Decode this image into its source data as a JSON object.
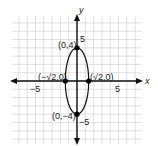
{
  "chart_data": {
    "type": "scatter",
    "title": "",
    "xlabel": "x",
    "ylabel": "y",
    "xlim": [
      -8,
      8
    ],
    "ylim": [
      -8,
      8
    ],
    "grid": true,
    "x_tick_labels": [
      "-5",
      "5"
    ],
    "y_tick_labels": [
      "5",
      "-5"
    ],
    "curve": {
      "kind": "ellipse",
      "center": [
        0,
        0
      ],
      "semi_axis_x": 1.414,
      "semi_axis_y": 4,
      "equation_hint": "x^2/2 + y^2/16 = 1"
    },
    "points": [
      {
        "x": 0,
        "y": 4,
        "label": "(0,4)"
      },
      {
        "x": 0,
        "y": -4,
        "label": "(0,−4)"
      },
      {
        "x": -1.414,
        "y": 0,
        "label": "(−√2,0)"
      },
      {
        "x": 1.414,
        "y": 0,
        "label": "(√2,0)"
      }
    ]
  },
  "labels": {
    "x_axis": "x",
    "y_axis": "y",
    "x_neg5": "−5",
    "x_pos5": "5",
    "y_pos5": "5",
    "y_neg5": "−5",
    "p_top": "(0,4)",
    "p_bottom": "(0,−4)",
    "p_left": "(−√2,0)",
    "p_right": "(√2,0)"
  },
  "colors": {
    "grid": "#d8d8d8",
    "axis": "#111111",
    "curve": "#111111",
    "point": "#000000"
  }
}
